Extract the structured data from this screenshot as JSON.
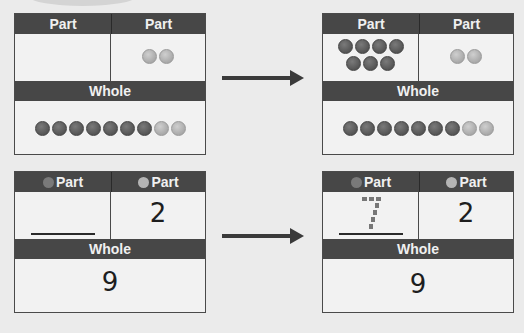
{
  "cards": {
    "top_left": {
      "part_left_label": "Part",
      "part_right_label": "Part",
      "whole_label": "Whole",
      "part_left_counters": [],
      "part_right_counters": [
        "light",
        "light"
      ],
      "whole_counters": [
        "dark",
        "dark",
        "dark",
        "dark",
        "dark",
        "dark",
        "dark",
        "light",
        "light"
      ]
    },
    "top_right": {
      "part_left_label": "Part",
      "part_right_label": "Part",
      "whole_label": "Whole",
      "part_left_counters_row1": [
        "dark",
        "dark",
        "dark",
        "dark"
      ],
      "part_left_counters_row2": [
        "dark",
        "dark",
        "dark"
      ],
      "part_right_counters": [
        "light",
        "light"
      ],
      "whole_counters": [
        "dark",
        "dark",
        "dark",
        "dark",
        "dark",
        "dark",
        "dark",
        "light",
        "light"
      ]
    },
    "bottom_left": {
      "part_left_label": "Part",
      "part_right_label": "Part",
      "whole_label": "Whole",
      "part_left_value": "",
      "part_right_value": "2",
      "whole_value": "9"
    },
    "bottom_right": {
      "part_left_label": "Part",
      "part_right_label": "Part",
      "whole_label": "Whole",
      "part_left_value": "7",
      "part_right_value": "2",
      "whole_value": "9"
    }
  },
  "colors": {
    "header_bg": "#474747",
    "counter_dark": "#5f5f5f",
    "counter_light": "#b5b5b5",
    "arrow": "#3a3a3a"
  }
}
